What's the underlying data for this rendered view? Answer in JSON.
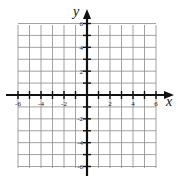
{
  "diagram": {
    "type": "coordinate-grid",
    "x_axis": {
      "label": "x",
      "min": -6,
      "max": 6,
      "tick_labels": [
        "-6",
        "-4",
        "-2",
        "2",
        "4",
        "6"
      ],
      "tick_values": [
        -6,
        -4,
        -2,
        2,
        4,
        6
      ]
    },
    "y_axis": {
      "label": "y",
      "min": -6,
      "max": 6,
      "tick_labels": [
        "6",
        "4",
        "2",
        "-2",
        "-4",
        "-6"
      ],
      "tick_values": [
        6,
        4,
        2,
        -2,
        -4,
        -6
      ]
    },
    "grid": {
      "step": 1,
      "cells_x": 12,
      "cells_y": 12
    },
    "colors": {
      "grid": "#8a8a8a",
      "axis": "#111111",
      "background": "#ffffff"
    }
  }
}
